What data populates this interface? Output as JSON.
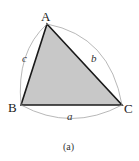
{
  "figure": {
    "caption": "(a)",
    "vertices": [
      {
        "name": "A",
        "x": 47,
        "y": 24
      },
      {
        "name": "B",
        "x": 21,
        "y": 105
      },
      {
        "name": "C",
        "x": 122,
        "y": 105
      }
    ],
    "sides": [
      {
        "name": "a",
        "between": [
          "B",
          "C"
        ]
      },
      {
        "name": "b",
        "between": [
          "A",
          "C"
        ]
      },
      {
        "name": "c",
        "between": [
          "A",
          "B"
        ]
      }
    ],
    "colors": {
      "fill": "#c8c8c8",
      "edge": "#1a1a1a",
      "arc": "#9a9a9a"
    }
  }
}
